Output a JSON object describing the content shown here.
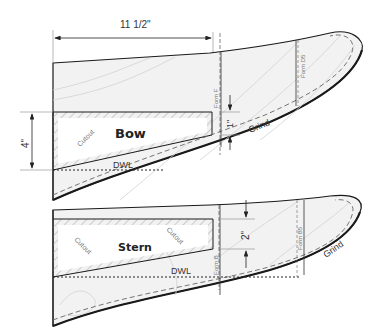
{
  "diagram": {
    "type": "boat hull template drawing",
    "colors": {
      "fill": "#f2f2f2",
      "outline": "#1a1a1a",
      "guide": "#888888",
      "hatch": "#bbbbbb",
      "grain": "#cfcfcf"
    },
    "dimensions": {
      "length": "11 1/2\"",
      "bow_height": "4\"",
      "bow_offset": "1\"",
      "stern_offset": "2\""
    },
    "bow_piece": {
      "label": "Bow",
      "cutout_label": "Cutout",
      "dwl_label": "DWL",
      "form_a": "Form F",
      "form_b": "Form D5",
      "grind_label": "Grind"
    },
    "stern_piece": {
      "label": "Stern",
      "cutout_label_left": "Cutout",
      "cutout_label_right": "Cutout",
      "dwl_label": "DWL",
      "form_a": "Form B",
      "form_b": "Form B5",
      "grind_label": "Grind"
    }
  }
}
